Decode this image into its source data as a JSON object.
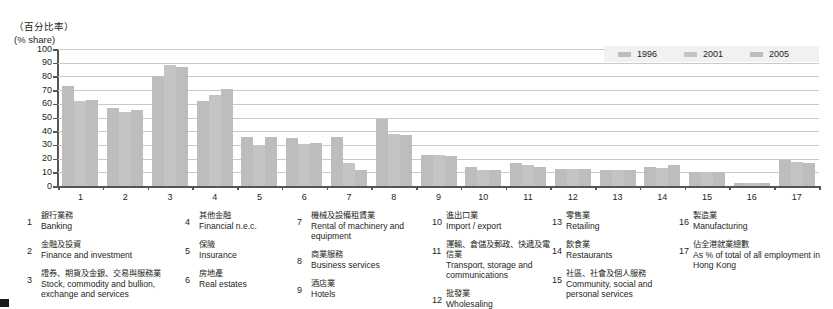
{
  "axis": {
    "unit_zh": "（百分比率）",
    "unit_en": "(% share)",
    "y_ticks": [
      "100",
      "90",
      "80",
      "70",
      "60",
      "50",
      "40",
      "30",
      "20",
      "10",
      "0"
    ],
    "x_labels": [
      "1",
      "2",
      "3",
      "4",
      "5",
      "6",
      "7",
      "8",
      "9",
      "10",
      "11",
      "12",
      "13",
      "14",
      "15",
      "16",
      "17"
    ]
  },
  "legend": {
    "items": [
      {
        "label": "1996",
        "color": "#bdbdbd"
      },
      {
        "label": "2001",
        "color": "#c4c4c4"
      },
      {
        "label": "2005",
        "color": "#bdbdbd"
      }
    ]
  },
  "chart_data": {
    "type": "bar",
    "title": "",
    "xlabel": "",
    "ylabel": "(% share)",
    "ylim": [
      0,
      100
    ],
    "ytick_step": 10,
    "grid": true,
    "legend_position": "top-right",
    "categories": [
      "1",
      "2",
      "3",
      "4",
      "5",
      "6",
      "7",
      "8",
      "9",
      "10",
      "11",
      "12",
      "13",
      "14",
      "15",
      "16",
      "17"
    ],
    "category_names": [
      "Banking",
      "Finance and investment",
      "Stock, commodity and bullion, exchange and services",
      "Financial n.e.c.",
      "Insurance",
      "Real estates",
      "Rental of machinery and equipment",
      "Business services",
      "Hotels",
      "Import / export",
      "Transport, storage and communications",
      "Wholesaling",
      "Retailing",
      "Restaurants",
      "Community, social and personal services",
      "Manufacturing",
      "As % of total of all employment in Hong Kong"
    ],
    "series": [
      {
        "name": "1996",
        "color": "#bdbdbd",
        "values": [
          73,
          57,
          80,
          62,
          36,
          35,
          35.5,
          49,
          23,
          14,
          17,
          12.5,
          12,
          14,
          10,
          2,
          19
        ]
      },
      {
        "name": "2001",
        "color": "#c4c4c4",
        "values": [
          62,
          54,
          88,
          66.5,
          29.5,
          31,
          17,
          38,
          23,
          12,
          15.5,
          12.5,
          12,
          13.5,
          10.5,
          2.5,
          17.5
        ]
      },
      {
        "name": "2005",
        "color": "#bdbdbd",
        "values": [
          62.5,
          55.5,
          87,
          71,
          35.5,
          31.5,
          12,
          37,
          22,
          12,
          14,
          12.5,
          11.5,
          15.5,
          10,
          2,
          17
        ]
      }
    ]
  },
  "key": {
    "entries": [
      {
        "num": "1",
        "zh": "銀行業務",
        "en": "Banking"
      },
      {
        "num": "2",
        "zh": "金融及投資",
        "en": "Finance and investment"
      },
      {
        "num": "3",
        "zh": "證券、期貨及金銀、交易與服務業",
        "en": "Stock, commodity and bullion, exchange and services"
      },
      {
        "num": "4",
        "zh": "其他金融",
        "en": "Financial n.e.c."
      },
      {
        "num": "5",
        "zh": "保險",
        "en": "Insurance"
      },
      {
        "num": "6",
        "zh": "房地產",
        "en": "Real estates"
      },
      {
        "num": "7",
        "zh": "機械及設備租賃業",
        "en": "Rental of machinery and equipment"
      },
      {
        "num": "8",
        "zh": "商業服務",
        "en": "Business services"
      },
      {
        "num": "9",
        "zh": "酒店業",
        "en": "Hotels"
      },
      {
        "num": "10",
        "zh": "進出口業",
        "en": "Import / export"
      },
      {
        "num": "11",
        "zh": "運輸、倉儲及郵政、快遞及電信業",
        "en": "Transport, storage and communications"
      },
      {
        "num": "12",
        "zh": "批發業",
        "en": "Wholesaling"
      },
      {
        "num": "13",
        "zh": "零售業",
        "en": "Retailing"
      },
      {
        "num": "14",
        "zh": "飲食業",
        "en": "Restaurants"
      },
      {
        "num": "15",
        "zh": "社區、社會及個人服務",
        "en": "Community, social and personal services"
      },
      {
        "num": "16",
        "zh": "製造業",
        "en": "Manufacturing"
      },
      {
        "num": "17",
        "zh": "佔全港就業總數",
        "en": "As % of total of all employment in Hong Kong"
      }
    ]
  }
}
